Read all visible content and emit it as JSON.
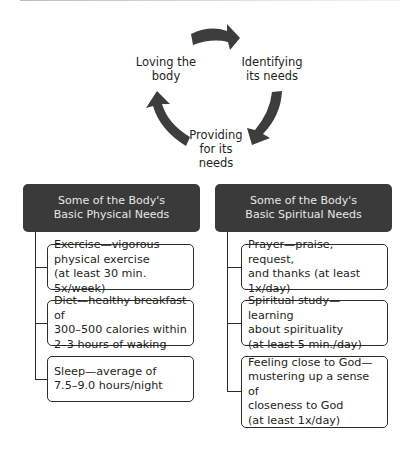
{
  "cycle": {
    "steps": [
      {
        "label_line1": "Loving the",
        "label_line2": "body"
      },
      {
        "label_line1": "Identifying",
        "label_line2": "its needs"
      },
      {
        "label_line1": "Providing",
        "label_line2": "for its",
        "label_line3": "needs"
      }
    ],
    "arrow_color": "#3d3d3d"
  },
  "physical": {
    "header_line1": "Some of the Body's",
    "header_line2": "Basic Physical Needs",
    "items": [
      {
        "lines": [
          "Exercise—vigorous",
          "physical exercise",
          "(at least 30 min. 5x/week)"
        ]
      },
      {
        "lines": [
          "Diet—healthy breakfast of",
          "300–500 calories within",
          "2–3 hours of waking"
        ]
      },
      {
        "lines": [
          "Sleep—average of",
          "7.5–9.0 hours/night"
        ]
      }
    ]
  },
  "spiritual": {
    "header_line1": "Some of the Body's",
    "header_line2": "Basic Spiritual Needs",
    "items": [
      {
        "lines": [
          "Prayer—praise, request,",
          "and thanks (at least 1x/day)"
        ]
      },
      {
        "lines": [
          "Spiritual study—learning",
          "about spirituality",
          "(at least 5 min./day)"
        ]
      },
      {
        "lines": [
          "Feeling close to God—",
          "mustering up a sense of",
          "closeness to God",
          "(at least 1x/day)"
        ]
      }
    ]
  },
  "colors": {
    "header_bg": "#3a3a3a",
    "header_text": "#e8e8e8",
    "border": "#2c2c2c"
  }
}
